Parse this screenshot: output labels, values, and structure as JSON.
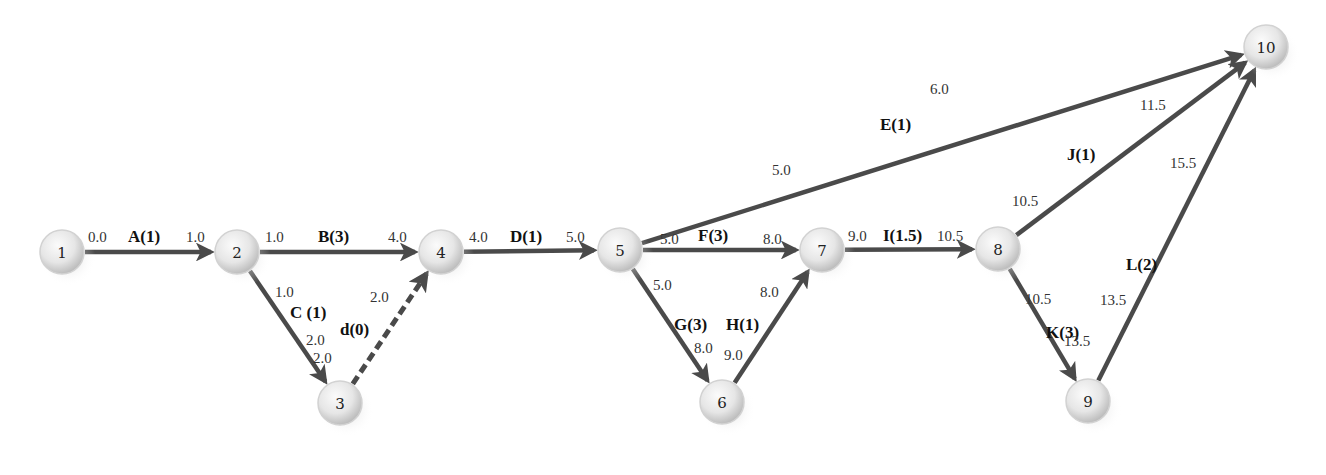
{
  "diagram": {
    "type": "activity-on-arrow network (PERT/CPM)",
    "nodes": [
      {
        "id": "1",
        "label": "1",
        "x": 62,
        "y": 252
      },
      {
        "id": "2",
        "label": "2",
        "x": 237,
        "y": 252
      },
      {
        "id": "3",
        "label": "3",
        "x": 340,
        "y": 403
      },
      {
        "id": "4",
        "label": "4",
        "x": 441,
        "y": 252
      },
      {
        "id": "5",
        "label": "5",
        "x": 620,
        "y": 250
      },
      {
        "id": "6",
        "label": "6",
        "x": 722,
        "y": 402
      },
      {
        "id": "7",
        "label": "7",
        "x": 822,
        "y": 250
      },
      {
        "id": "8",
        "label": "8",
        "x": 998,
        "y": 249
      },
      {
        "id": "9",
        "label": "9",
        "x": 1088,
        "y": 401
      },
      {
        "id": "10",
        "label": "10",
        "x": 1266,
        "y": 47
      }
    ],
    "edges": [
      {
        "id": "A",
        "from": "1",
        "to": "2",
        "label": "A(1)",
        "start": "0.0",
        "end": "1.0",
        "dummy": false
      },
      {
        "id": "B",
        "from": "2",
        "to": "4",
        "label": "B(3)",
        "start": "1.0",
        "end": "4.0",
        "dummy": false
      },
      {
        "id": "C",
        "from": "2",
        "to": "3",
        "label": "C (1)",
        "start": "1.0",
        "end": "2.0",
        "dummy": false
      },
      {
        "id": "d",
        "from": "3",
        "to": "4",
        "label": "d(0)",
        "start": "2.0",
        "end": "2.0",
        "dummy": true
      },
      {
        "id": "D",
        "from": "4",
        "to": "5",
        "label": "D(1)",
        "start": "4.0",
        "end": "5.0",
        "dummy": false
      },
      {
        "id": "E",
        "from": "5",
        "to": "10",
        "label": "E(1)",
        "start": "5.0",
        "end": "6.0",
        "dummy": false
      },
      {
        "id": "F",
        "from": "5",
        "to": "7",
        "label": "F(3)",
        "start": "5.0",
        "end": "8.0",
        "dummy": false
      },
      {
        "id": "G",
        "from": "5",
        "to": "6",
        "label": "G(3)",
        "start": "5.0",
        "end": "8.0",
        "dummy": false
      },
      {
        "id": "H",
        "from": "6",
        "to": "7",
        "label": "H(1)",
        "start": "8.0",
        "end": "9.0",
        "dummy": false
      },
      {
        "id": "I",
        "from": "7",
        "to": "8",
        "label": "I(1.5)",
        "start": "9.0",
        "end": "10.5",
        "dummy": false
      },
      {
        "id": "J",
        "from": "8",
        "to": "10",
        "label": "J(1)",
        "start": "10.5",
        "end": "11.5",
        "dummy": false
      },
      {
        "id": "K",
        "from": "8",
        "to": "9",
        "label": "K(3)",
        "start": "10.5",
        "end": "13.5",
        "dummy": false
      },
      {
        "id": "L",
        "from": "9",
        "to": "10",
        "label": "L(2)",
        "start": "13.5",
        "end": "15.5",
        "dummy": false
      }
    ],
    "colors": {
      "edge": "#4a4a4a",
      "node_fill_light": "#f4f4f4",
      "node_fill_dark": "#c8c8c8",
      "text": "#222222"
    }
  }
}
